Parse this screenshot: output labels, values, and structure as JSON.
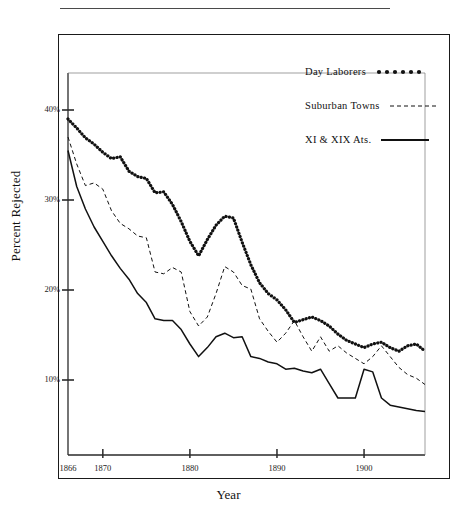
{
  "figure": {
    "y_axis_title": "Percent Rejected",
    "x_axis_title": "Year"
  },
  "axes": {
    "y_ticks": [
      {
        "label": "40%",
        "value": 40
      },
      {
        "label": "30%",
        "value": 30
      },
      {
        "label": "20%",
        "value": 20
      },
      {
        "label": "10%",
        "value": 10
      }
    ],
    "x_ticks": [
      {
        "label": "1866",
        "value": 1866
      },
      {
        "label": "1870",
        "value": 1870
      },
      {
        "label": "1880",
        "value": 1880
      },
      {
        "label": "1890",
        "value": 1890
      },
      {
        "label": "1900",
        "value": 1900
      }
    ]
  },
  "legend": {
    "position": "top-right",
    "entries": [
      {
        "label": "Day Laborers",
        "key": "dotted-thick"
      },
      {
        "label": "Suburban Towns",
        "key": "dashed-thin"
      },
      {
        "label": "XI & XIX Ats.",
        "key": "solid"
      }
    ]
  },
  "colors": {
    "ink": "#111111",
    "frame": "#1a1a1a",
    "axis": "#2a2a2a",
    "background": "#ffffff"
  },
  "chart_data": {
    "type": "line",
    "title": "",
    "xlabel": "Year",
    "ylabel": "Percent Rejected",
    "xlim": [
      1866,
      1907
    ],
    "ylim": [
      3,
      43
    ],
    "grid": false,
    "legend_position": "top-right",
    "x": [
      1866,
      1867,
      1868,
      1869,
      1870,
      1871,
      1872,
      1873,
      1874,
      1875,
      1876,
      1877,
      1878,
      1879,
      1880,
      1881,
      1882,
      1883,
      1884,
      1885,
      1886,
      1887,
      1888,
      1889,
      1890,
      1891,
      1892,
      1893,
      1894,
      1895,
      1896,
      1897,
      1898,
      1899,
      1900,
      1901,
      1902,
      1903,
      1904,
      1905,
      1906,
      1907
    ],
    "series": [
      {
        "name": "Day Laborers",
        "style": "dotted-thick",
        "values": [
          39.0,
          38.0,
          36.9,
          36.2,
          35.3,
          34.6,
          34.8,
          33.2,
          32.6,
          32.4,
          30.8,
          30.9,
          29.5,
          27.6,
          25.4,
          23.8,
          25.6,
          27.2,
          28.2,
          28.0,
          25.3,
          22.8,
          20.8,
          19.6,
          18.9,
          17.8,
          16.4,
          16.7,
          17.0,
          16.6,
          16.0,
          15.1,
          14.4,
          14.0,
          13.6,
          14.0,
          14.2,
          13.6,
          13.2,
          13.8,
          14.0,
          13.2
        ]
      },
      {
        "name": "Suburban Towns",
        "style": "dashed-thin",
        "values": [
          37.0,
          34.0,
          31.6,
          31.9,
          31.2,
          28.8,
          27.4,
          26.8,
          26.0,
          25.8,
          22.0,
          21.8,
          22.5,
          22.0,
          17.6,
          16.0,
          17.0,
          19.6,
          22.6,
          22.0,
          20.5,
          20.1,
          16.8,
          15.4,
          14.2,
          15.2,
          16.6,
          14.8,
          13.2,
          14.8,
          13.2,
          13.8,
          13.0,
          12.4,
          11.8,
          12.6,
          13.8,
          12.6,
          11.4,
          10.6,
          10.2,
          9.5
        ]
      },
      {
        "name": "XI & XIX Ats.",
        "style": "solid",
        "values": [
          35.5,
          31.5,
          29.0,
          27.0,
          25.4,
          23.8,
          22.4,
          21.2,
          19.6,
          18.6,
          16.8,
          16.6,
          16.6,
          15.6,
          14.0,
          12.6,
          13.6,
          14.8,
          15.2,
          14.7,
          14.8,
          12.6,
          12.4,
          12.0,
          11.8,
          11.2,
          11.3,
          11.0,
          10.8,
          11.2,
          9.6,
          8.0,
          8.0,
          8.0,
          11.2,
          10.9,
          8.0,
          7.2,
          7.0,
          6.8,
          6.6,
          6.5
        ]
      }
    ]
  }
}
